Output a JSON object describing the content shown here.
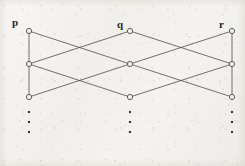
{
  "figure": {
    "kind": "bipartite-layered-graph-diagram",
    "background_color": "#f2f0ec",
    "ink_color": "#3a3733",
    "node_fill": "#f6f5f2",
    "node_radius": 2.6,
    "edge_width": 0.7,
    "labels": [
      {
        "id": "label-p",
        "text": "p",
        "x": 12,
        "y": 17
      },
      {
        "id": "label-q",
        "text": "q",
        "x": 117,
        "y": 19
      },
      {
        "id": "label-r",
        "text": "r",
        "x": 219,
        "y": 19
      }
    ],
    "columns": [
      {
        "id": "p",
        "name": "p",
        "x": 29,
        "has_spine": true,
        "node_ys": [
          31,
          64,
          97
        ]
      },
      {
        "id": "q",
        "name": "q",
        "x": 130,
        "has_spine": false,
        "node_ys": [
          31,
          64,
          97
        ]
      },
      {
        "id": "r",
        "name": "r",
        "x": 232,
        "has_spine": true,
        "node_ys": [
          31,
          64,
          97
        ]
      }
    ],
    "spines": [
      {
        "id": "spine-p",
        "column": "p",
        "x": 29,
        "y1": 31,
        "y2": 97
      },
      {
        "id": "spine-r",
        "column": "r",
        "x": 232,
        "y1": 31,
        "y2": 97
      }
    ],
    "cross_edges": [
      {
        "id": "e-p1-q2",
        "from": "p1",
        "to": "q2",
        "x1": 29,
        "y1": 31,
        "x2": 130,
        "y2": 64
      },
      {
        "id": "e-p2-q1",
        "from": "p2",
        "to": "q1",
        "x1": 29,
        "y1": 64,
        "x2": 130,
        "y2": 31
      },
      {
        "id": "e-p2-q3",
        "from": "p2",
        "to": "q3",
        "x1": 29,
        "y1": 64,
        "x2": 130,
        "y2": 97
      },
      {
        "id": "e-p3-q2",
        "from": "p3",
        "to": "q2",
        "x1": 29,
        "y1": 97,
        "x2": 130,
        "y2": 64
      },
      {
        "id": "e-q1-r2",
        "from": "q1",
        "to": "r2",
        "x1": 130,
        "y1": 31,
        "x2": 232,
        "y2": 64
      },
      {
        "id": "e-q2-r1",
        "from": "q2",
        "to": "r1",
        "x1": 130,
        "y1": 64,
        "x2": 232,
        "y2": 31
      },
      {
        "id": "e-q2-r3",
        "from": "q2",
        "to": "r3",
        "x1": 130,
        "y1": 64,
        "x2": 232,
        "y2": 97
      },
      {
        "id": "e-q3-r2",
        "from": "q3",
        "to": "r2",
        "x1": 130,
        "y1": 97,
        "x2": 232,
        "y2": 64
      }
    ],
    "nodes": [
      {
        "id": "p1",
        "column": "p",
        "index": 1,
        "x": 29,
        "y": 31
      },
      {
        "id": "p2",
        "column": "p",
        "index": 2,
        "x": 29,
        "y": 64
      },
      {
        "id": "p3",
        "column": "p",
        "index": 3,
        "x": 29,
        "y": 97
      },
      {
        "id": "q1",
        "column": "q",
        "index": 1,
        "x": 130,
        "y": 31
      },
      {
        "id": "q2",
        "column": "q",
        "index": 2,
        "x": 130,
        "y": 64
      },
      {
        "id": "q3",
        "column": "q",
        "index": 3,
        "x": 130,
        "y": 97
      },
      {
        "id": "r1",
        "column": "r",
        "index": 1,
        "x": 232,
        "y": 31
      },
      {
        "id": "r2",
        "column": "r",
        "index": 2,
        "x": 232,
        "y": 64
      },
      {
        "id": "r3",
        "column": "r",
        "index": 3,
        "x": 232,
        "y": 97
      }
    ],
    "continuation_dots": [
      {
        "id": "dots-p",
        "column": "p",
        "x": 29,
        "ys": [
          112,
          122,
          132
        ]
      },
      {
        "id": "dots-q",
        "column": "q",
        "x": 130,
        "ys": [
          112,
          122,
          132
        ]
      },
      {
        "id": "dots-r",
        "column": "r",
        "x": 232,
        "ys": [
          112,
          122,
          132
        ]
      }
    ],
    "dot_size": 2.1
  }
}
